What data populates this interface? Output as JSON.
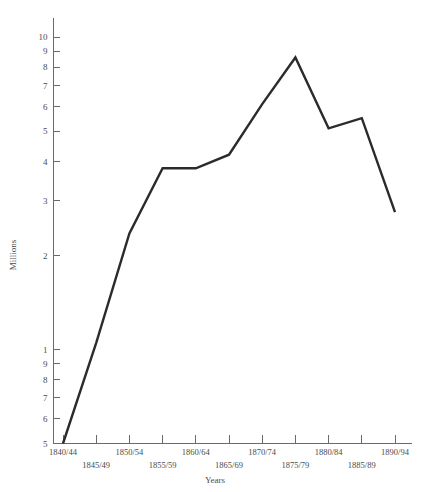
{
  "chart_data": {
    "type": "line",
    "title": "",
    "xlabel": "Years",
    "ylabel": "Millions",
    "yscale": "log",
    "ylim": [
      0.5,
      11
    ],
    "grid": false,
    "legend": null,
    "categories": [
      "1840/44",
      "1845/49",
      "1850/54",
      "1855/59",
      "1860/64",
      "1865/69",
      "1870/74",
      "1875/79",
      "1880/84",
      "1885/89",
      "1890/94"
    ],
    "values": [
      0.5,
      1.05,
      2.35,
      3.8,
      3.8,
      4.2,
      6.1,
      8.6,
      5.1,
      5.5,
      2.75
    ],
    "series": [
      {
        "name": "Emigration",
        "values": [
          0.5,
          1.05,
          2.35,
          3.8,
          3.8,
          4.2,
          6.1,
          8.6,
          5.1,
          5.5,
          2.75
        ]
      }
    ],
    "y_tick_labels": [
      "5",
      "6",
      "7",
      "8",
      "9",
      "1",
      "2",
      "3",
      "4",
      "5",
      "6",
      "7",
      "8",
      "9",
      "10"
    ],
    "y_tick_values": [
      0.5,
      0.6,
      0.7,
      0.8,
      0.9,
      1,
      2,
      3,
      4,
      5,
      6,
      7,
      8,
      9,
      10
    ],
    "x_tick_labels_top": [
      "1840/44",
      "1850/54",
      "1860/64",
      "1870/74",
      "1880/84",
      "1890/94"
    ],
    "x_tick_labels_bottom": [
      "1845/49",
      "1855/59",
      "1865/69",
      "1875/79",
      "1885/89"
    ],
    "axis_color": "#6a6a6a",
    "line_color": "#2b2b2b"
  },
  "labels": {
    "y_axis_title": "Millions",
    "x_axis_title": "Years"
  }
}
